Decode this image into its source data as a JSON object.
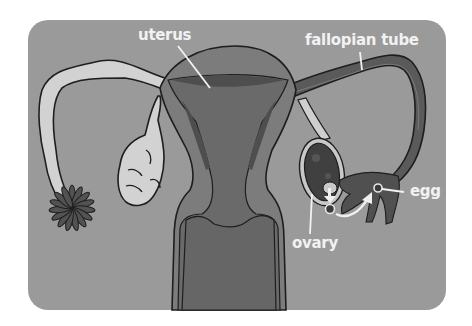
{
  "diagram": {
    "background_color": "#999999",
    "labels": {
      "uterus": "uterus",
      "fallopian_tube": "fallopian tube",
      "egg": "egg",
      "ovary": "ovary"
    },
    "colors": {
      "card": "#9a9a9a",
      "uterus_outer": "#7e7e7e",
      "uterus_inner": "#6a6a6a",
      "lining": "#555555",
      "left_tube": "#d0d0d0",
      "right_tube": "#5a5a5a",
      "fimbriae": "#505050",
      "ovary_dark": "#404040",
      "outline": "#1e1e1e",
      "label_text": "#f2f2f2"
    }
  }
}
